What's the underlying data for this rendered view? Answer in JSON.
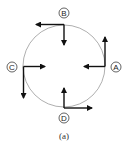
{
  "diagram": {
    "caption": "(a)",
    "circle": {
      "cx": 64,
      "cy": 66,
      "r": 41,
      "stroke": "#9a9a9a"
    },
    "points": [
      {
        "id": "A",
        "label": "A",
        "position": "right",
        "arrows": [
          "up",
          "left"
        ]
      },
      {
        "id": "B",
        "label": "B",
        "position": "top",
        "arrows": [
          "left",
          "down"
        ]
      },
      {
        "id": "C",
        "label": "C",
        "position": "left",
        "arrows": [
          "right",
          "down"
        ]
      },
      {
        "id": "D",
        "label": "D",
        "position": "bottom",
        "arrows": [
          "up",
          "right"
        ]
      }
    ],
    "arrow_color": "#111111"
  }
}
